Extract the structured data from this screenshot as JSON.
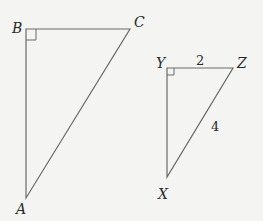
{
  "triangles": [
    {
      "name": "ABC",
      "vertices": {
        "B": "B",
        "C": "C",
        "A": "A"
      },
      "right_angle_at": "B"
    },
    {
      "name": "XYZ",
      "vertices": {
        "Y": "Y",
        "Z": "Z",
        "X": "X"
      },
      "right_angle_at": "Y",
      "side_labels": {
        "YZ": "2",
        "XZ": "4"
      }
    }
  ],
  "colors": {
    "line": "#6a6a6a",
    "text": "#2a2a2a",
    "background": "#f4f4f3"
  }
}
